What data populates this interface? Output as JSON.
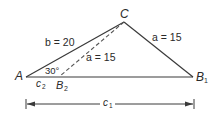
{
  "figure": {
    "vertices": {
      "A": {
        "label": "A",
        "x": 26,
        "y": 77
      },
      "C": {
        "label": "C",
        "x": 124,
        "y": 22
      },
      "B1": {
        "label": "B",
        "sub": "1",
        "x": 193,
        "y": 77
      },
      "B2": {
        "label": "B",
        "sub": "2",
        "x": 60,
        "y": 77
      }
    },
    "side_labels": {
      "b": "b = 20",
      "a_outer": "a = 15",
      "a_inner": "a = 15"
    },
    "angle_label": "30°",
    "segment_labels": {
      "c2": {
        "label": "c",
        "sub": "2"
      },
      "c1": {
        "label": "c",
        "sub": "1"
      }
    },
    "colors": {
      "line": "#3a3a3a",
      "dashed": "#555555",
      "text": "#2a2a2a"
    }
  }
}
